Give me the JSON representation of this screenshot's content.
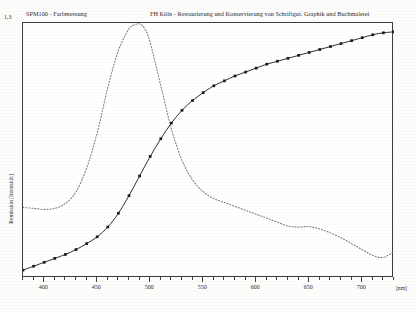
{
  "header": {
    "left_title": "SPM100 - Farbmessung",
    "right_title": "FH Köln - Restaurierung und Konservierung von Schriftgut, Graphik und Buchmalerei"
  },
  "axes": {
    "y_max_label": "1,3",
    "y_axis_title": "Remission [Intensität]",
    "x_unit_label": "[nm]"
  },
  "chart_data": {
    "type": "line",
    "title": "SPM100 - Farbmessung",
    "xlabel": "[nm]",
    "ylabel": "Remission [Intensität]",
    "xlim": [
      380,
      730
    ],
    "ylim": [
      0,
      1.3
    ],
    "xtick_labels": [
      "400",
      "450",
      "500",
      "550",
      "600",
      "650",
      "700"
    ],
    "xticks_major": [
      400,
      450,
      500,
      550,
      600,
      650,
      700
    ],
    "xticks_minor_step": 10,
    "yticks": [
      0,
      1.3
    ],
    "grid": false,
    "legend": "none",
    "series": [
      {
        "name": "Remissionskurve",
        "style": "solid-with-square-markers",
        "color": "#1a1a1a",
        "x": [
          380,
          390,
          400,
          410,
          420,
          430,
          440,
          450,
          460,
          470,
          480,
          490,
          500,
          510,
          520,
          530,
          540,
          550,
          560,
          570,
          580,
          590,
          600,
          610,
          620,
          630,
          640,
          650,
          660,
          670,
          680,
          690,
          700,
          710,
          720,
          730
        ],
        "y": [
          0.04,
          0.06,
          0.08,
          0.1,
          0.12,
          0.145,
          0.175,
          0.21,
          0.26,
          0.33,
          0.42,
          0.52,
          0.62,
          0.71,
          0.79,
          0.855,
          0.905,
          0.945,
          0.98,
          1.005,
          1.03,
          1.05,
          1.07,
          1.09,
          1.105,
          1.12,
          1.135,
          1.15,
          1.165,
          1.18,
          1.195,
          1.21,
          1.225,
          1.24,
          1.25,
          1.255
        ]
      },
      {
        "name": "Anregungs-/Normspektrum",
        "style": "dotted",
        "color": "#7a7a7a",
        "x": [
          380,
          390,
          400,
          410,
          420,
          430,
          440,
          450,
          460,
          470,
          480,
          485,
          490,
          495,
          500,
          510,
          520,
          530,
          540,
          550,
          560,
          570,
          580,
          590,
          600,
          610,
          620,
          630,
          640,
          650,
          660,
          670,
          680,
          690,
          700,
          710,
          720,
          730
        ],
        "y": [
          0.36,
          0.355,
          0.35,
          0.355,
          0.38,
          0.44,
          0.56,
          0.74,
          0.97,
          1.16,
          1.27,
          1.29,
          1.295,
          1.27,
          1.2,
          0.98,
          0.76,
          0.6,
          0.5,
          0.44,
          0.405,
          0.385,
          0.365,
          0.345,
          0.325,
          0.305,
          0.285,
          0.265,
          0.26,
          0.262,
          0.25,
          0.23,
          0.205,
          0.175,
          0.145,
          0.115,
          0.105,
          0.135
        ]
      }
    ]
  }
}
